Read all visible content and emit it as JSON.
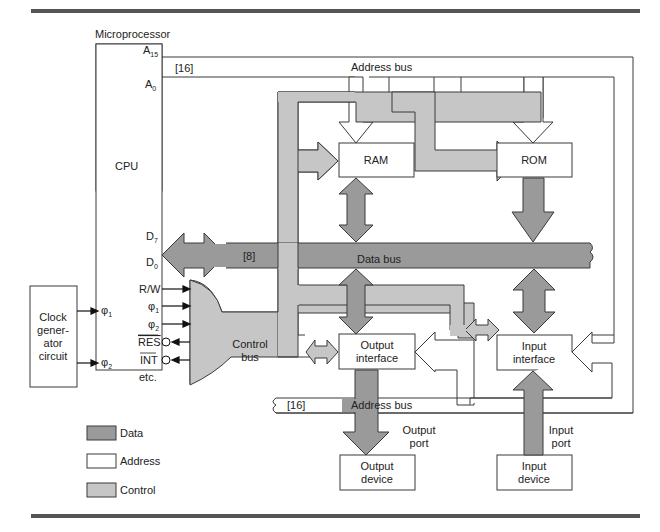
{
  "colors": {
    "data": "#9a9a9a",
    "address": "#ffffff",
    "control": "#c6c6c6",
    "stroke": "#3a3a3a",
    "rule": "#555555"
  },
  "microprocessor": {
    "title": "Microprocessor",
    "cpu_label": "CPU",
    "pins": {
      "a15": "A",
      "a15_sub": "15",
      "a0": "A",
      "a0_sub": "0",
      "d7": "D",
      "d7_sub": "7",
      "d0": "D",
      "d0_sub": "0",
      "rw": "R/W",
      "phi1": "φ",
      "phi1_sub": "1",
      "phi2": "φ",
      "phi2_sub": "2",
      "res": "RES",
      "int": "INT",
      "etc": "etc.",
      "clk_phi1": "φ",
      "clk_phi1_sub": "1",
      "clk_phi2": "φ",
      "clk_phi2_sub": "2"
    }
  },
  "clock": {
    "lines": [
      "Clock",
      "gener-",
      "ator",
      "circuit"
    ]
  },
  "buses": {
    "address_top": {
      "label": "Address bus",
      "width": "[16]"
    },
    "data": {
      "label": "Data bus",
      "width": "[8]"
    },
    "control": {
      "lines": [
        "Control",
        "bus"
      ]
    },
    "address_bottom": {
      "label": "Address bus",
      "width": "[16]"
    }
  },
  "blocks": {
    "ram": "RAM",
    "rom": "ROM",
    "output_interface": [
      "Output",
      "interface"
    ],
    "input_interface": [
      "Input",
      "interface"
    ],
    "output_device": [
      "Output",
      "device"
    ],
    "input_device": [
      "Input",
      "device"
    ]
  },
  "ports": {
    "output": [
      "Output",
      "port"
    ],
    "input": [
      "Input",
      "port"
    ]
  },
  "legend": [
    {
      "label": "Data",
      "swatch": "data"
    },
    {
      "label": "Address",
      "swatch": "address"
    },
    {
      "label": "Control",
      "swatch": "control"
    }
  ]
}
